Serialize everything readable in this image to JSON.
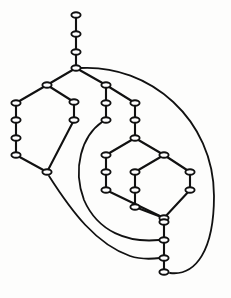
{
  "diagram": {
    "type": "node-link-diagram",
    "background_color": "#fdfdfc",
    "node_color": "#ffffff",
    "node_stroke_color": "#111111",
    "edge_color": "#111111",
    "node_count": 33,
    "node_shape": "ellipse",
    "node_rx": 4.6,
    "node_ry": 2.7,
    "nodes": [
      {
        "id": "n1",
        "x": 76,
        "y": 15
      },
      {
        "id": "n2",
        "x": 76,
        "y": 34
      },
      {
        "id": "n3",
        "x": 76,
        "y": 52
      },
      {
        "id": "n4",
        "x": 76,
        "y": 68
      },
      {
        "id": "n5",
        "x": 47,
        "y": 85
      },
      {
        "id": "n6",
        "x": 16,
        "y": 103
      },
      {
        "id": "n7",
        "x": 16,
        "y": 120
      },
      {
        "id": "n8",
        "x": 16,
        "y": 138
      },
      {
        "id": "n9",
        "x": 16,
        "y": 155
      },
      {
        "id": "n10",
        "x": 47,
        "y": 172
      },
      {
        "id": "n11",
        "x": 74,
        "y": 120
      },
      {
        "id": "n12",
        "x": 74,
        "y": 102
      },
      {
        "id": "n13",
        "x": 106,
        "y": 85
      },
      {
        "id": "n14",
        "x": 106,
        "y": 103
      },
      {
        "id": "n15",
        "x": 106,
        "y": 120
      },
      {
        "id": "n16",
        "x": 135,
        "y": 103
      },
      {
        "id": "n17",
        "x": 135,
        "y": 120
      },
      {
        "id": "n18",
        "x": 135,
        "y": 138
      },
      {
        "id": "n19",
        "x": 106,
        "y": 155
      },
      {
        "id": "n20",
        "x": 106,
        "y": 172
      },
      {
        "id": "n21",
        "x": 106,
        "y": 190
      },
      {
        "id": "n22",
        "x": 135,
        "y": 172
      },
      {
        "id": "n23",
        "x": 135,
        "y": 190
      },
      {
        "id": "n24",
        "x": 135,
        "y": 207
      },
      {
        "id": "n25",
        "x": 164,
        "y": 155
      },
      {
        "id": "n26",
        "x": 190,
        "y": 172
      },
      {
        "id": "n27",
        "x": 190,
        "y": 190
      },
      {
        "id": "n28",
        "x": 164,
        "y": 218
      },
      {
        "id": "n29",
        "x": 164,
        "y": 222
      },
      {
        "id": "n30",
        "x": 164,
        "y": 240
      },
      {
        "id": "n31",
        "x": 164,
        "y": 258
      },
      {
        "id": "n32",
        "x": 164,
        "y": 272
      }
    ],
    "straight_edges": [
      {
        "from": "n1",
        "to": "n2"
      },
      {
        "from": "n2",
        "to": "n3"
      },
      {
        "from": "n3",
        "to": "n4"
      },
      {
        "from": "n4",
        "to": "n5"
      },
      {
        "from": "n4",
        "to": "n13"
      },
      {
        "from": "n5",
        "to": "n6"
      },
      {
        "from": "n6",
        "to": "n7"
      },
      {
        "from": "n7",
        "to": "n8"
      },
      {
        "from": "n8",
        "to": "n9"
      },
      {
        "from": "n9",
        "to": "n10"
      },
      {
        "from": "n5",
        "to": "n12"
      },
      {
        "from": "n12",
        "to": "n11"
      },
      {
        "from": "n11",
        "to": "n10"
      },
      {
        "from": "n13",
        "to": "n14"
      },
      {
        "from": "n14",
        "to": "n15"
      },
      {
        "from": "n13",
        "to": "n16"
      },
      {
        "from": "n16",
        "to": "n17"
      },
      {
        "from": "n17",
        "to": "n18"
      },
      {
        "from": "n18",
        "to": "n19"
      },
      {
        "from": "n19",
        "to": "n20"
      },
      {
        "from": "n20",
        "to": "n21"
      },
      {
        "from": "n18",
        "to": "n25"
      },
      {
        "from": "n21",
        "to": "n28"
      },
      {
        "from": "n22",
        "to": "n23"
      },
      {
        "from": "n23",
        "to": "n24"
      },
      {
        "from": "n24",
        "to": "n28"
      },
      {
        "from": "n25",
        "to": "n22"
      },
      {
        "from": "n25",
        "to": "n26"
      },
      {
        "from": "n26",
        "to": "n27"
      },
      {
        "from": "n27",
        "to": "n28"
      },
      {
        "from": "n28",
        "to": "n30"
      },
      {
        "from": "n30",
        "to": "n31"
      },
      {
        "from": "n31",
        "to": "n32"
      }
    ],
    "curved_edges": [
      {
        "id": "outer-curve",
        "from": "n4",
        "to": "n32",
        "path": "M 80 68 C 150 64 214 120 214 196 C 214 250 196 276 170 273"
      },
      {
        "id": "middle-curve",
        "from": "n10",
        "to": "n31",
        "path": "M 49 176 C 72 212 96 244 130 256 C 142 260 152 259 160 258"
      },
      {
        "id": "inner-curve",
        "from": "n15",
        "to": "n30",
        "path": "M 102 122 C 82 136 72 168 84 200 C 98 232 128 243 159 240"
      }
    ]
  }
}
